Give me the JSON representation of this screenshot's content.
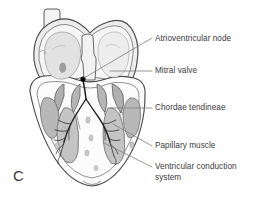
{
  "figure": {
    "panel_letter": "C",
    "caption_subject": "coronal section of the heart",
    "background_color": "#ffffff",
    "ink_color": "#3b3b3b"
  },
  "labels": [
    {
      "id": "atrioventricular-node",
      "text": "Atrioventricular node",
      "x": 155,
      "y": 34,
      "multiline": false
    },
    {
      "id": "mitral-valve",
      "text": "Mitral valve",
      "x": 155,
      "y": 68,
      "multiline": false
    },
    {
      "id": "chordae-tendineae",
      "text": "Chordae tendineae",
      "x": 155,
      "y": 105,
      "multiline": false
    },
    {
      "id": "papillary-muscle",
      "text": "Papillary muscle",
      "x": 155,
      "y": 143,
      "multiline": false
    },
    {
      "id": "ventricular-conduction-system",
      "text": "Ventricular conduction system",
      "x": 155,
      "y": 164,
      "multiline": true
    }
  ],
  "anatomy": {
    "tissue_outline_color": "#4a4a4a",
    "chamber_fill": "#f2f2f2",
    "atrial_wall_fill": "#e4e4e4",
    "papillary_muscle_fill": "#b4b4b4",
    "trabeculae_fill": "#c9c9c9",
    "conduction_fiber_color": "#1c1c1c",
    "av_node_marker_color": "#000000",
    "structures": [
      "superior vena cava stub",
      "right atrium",
      "left atrium",
      "interatrial septum",
      "atrioventricular node",
      "bundle of His",
      "left bundle branch",
      "right bundle branch",
      "Purkinje fibers",
      "mitral valve leaflets",
      "tricuspid valve leaflets",
      "chordae tendineae",
      "papillary muscles",
      "interventricular septum",
      "left ventricle",
      "right ventricle",
      "cardiac apex"
    ]
  },
  "leader_lines": [
    {
      "id": "leader-av-node",
      "from_x": 152,
      "from_y": 38,
      "to_x": 83,
      "to_y": 78
    },
    {
      "id": "leader-mitral-valve",
      "from_x": 152,
      "from_y": 71,
      "to_x": 112,
      "to_y": 71
    },
    {
      "id": "leader-chordae",
      "from_x": 152,
      "from_y": 108,
      "to_x": 112,
      "to_y": 108
    },
    {
      "id": "leader-papillary",
      "from_x": 152,
      "from_y": 146,
      "to_x": 113,
      "to_y": 124
    },
    {
      "id": "leader-conduction",
      "from_x": 152,
      "from_y": 167,
      "to_x": 106,
      "to_y": 143
    }
  ]
}
